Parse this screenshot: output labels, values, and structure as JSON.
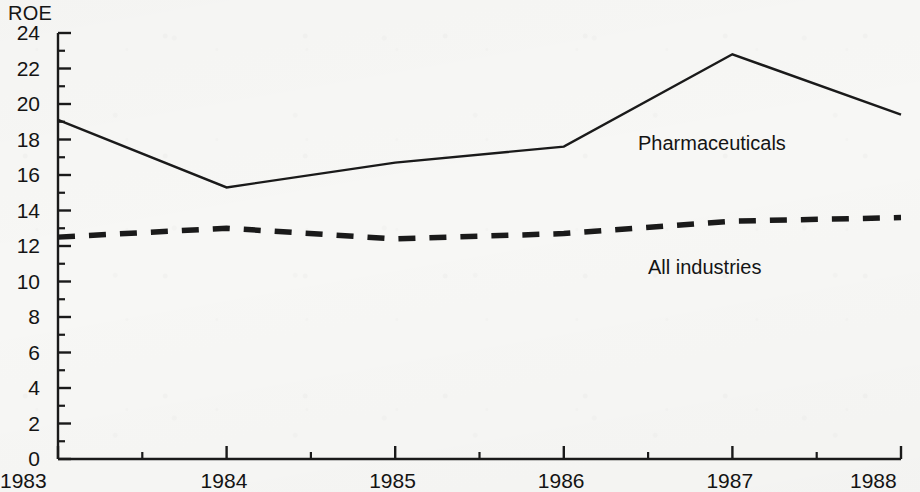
{
  "chart_data": {
    "type": "line",
    "title": "",
    "ylabel": "ROE",
    "xlabel": "",
    "x": [
      1983,
      1984,
      1985,
      1986,
      1987,
      1988
    ],
    "xtick_labels": [
      "1983",
      "1984",
      "1985",
      "1986",
      "1987",
      "1988"
    ],
    "ytick_labels": [
      "0",
      "2",
      "4",
      "6",
      "8",
      "10",
      "12",
      "14",
      "16",
      "18",
      "20",
      "22",
      "24"
    ],
    "ytick_values": [
      0,
      2,
      4,
      6,
      8,
      10,
      12,
      14,
      16,
      18,
      20,
      22,
      24
    ],
    "minor_ytick_values": [
      1,
      3,
      5,
      7,
      9,
      11,
      13,
      15,
      17,
      19,
      21,
      23
    ],
    "ylim": [
      0,
      24
    ],
    "xlim": [
      1983,
      1988
    ],
    "grid": false,
    "legend_position": "inline-annotation",
    "series": [
      {
        "name": "Pharmaceuticals",
        "style": "solid",
        "color": "#1a1a1a",
        "values": [
          19.1,
          15.3,
          16.7,
          17.6,
          22.8,
          19.4
        ]
      },
      {
        "name": "All industries",
        "style": "dashed",
        "color": "#1a1a1a",
        "values": [
          12.5,
          13.0,
          12.4,
          12.7,
          13.4,
          13.6
        ]
      }
    ],
    "annotations": [
      {
        "text": "Pharmaceuticals",
        "x": 638,
        "y": 133
      },
      {
        "text": "All industries",
        "x": 648,
        "y": 257
      }
    ]
  },
  "geometry": {
    "plot_left": 58,
    "plot_right": 901,
    "plot_top": 33,
    "plot_bottom": 459,
    "y_axis_label_x": 8,
    "y_axis_label_y": 2
  }
}
